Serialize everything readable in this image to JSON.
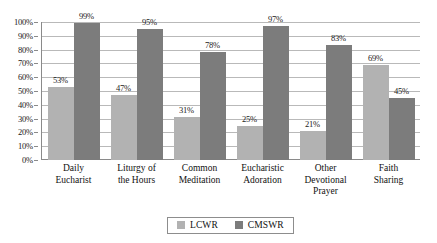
{
  "chart_data": {
    "type": "bar",
    "title": "",
    "xlabel": "",
    "ylabel": "",
    "ylim": [
      0,
      100
    ],
    "grid": true,
    "legend_position": "bottom",
    "categories": [
      "Daily\nEucharist",
      "Liturgy of\nthe Hours",
      "Common\nMeditation",
      "Eucharistic\nAdoration",
      "Other\nDevotional\nPrayer",
      "Faith\nSharing"
    ],
    "ticks": [
      "0%",
      "10%",
      "20%",
      "30%",
      "40%",
      "50%",
      "60%",
      "70%",
      "80%",
      "90%",
      "100%"
    ],
    "series": [
      {
        "name": "LCWR",
        "color": "#b2b2b2",
        "values": [
          53,
          47,
          31,
          25,
          21,
          69
        ],
        "labels": [
          "53%",
          "47%",
          "31%",
          "25%",
          "21%",
          "69%"
        ]
      },
      {
        "name": "CMSWR",
        "color": "#7c7c7c",
        "values": [
          99,
          95,
          78,
          97,
          83,
          45
        ],
        "labels": [
          "99%",
          "95%",
          "78%",
          "97%",
          "83%",
          "45%"
        ]
      }
    ]
  },
  "legend": {
    "items": [
      {
        "label": "LCWR",
        "swatch": "#b2b2b2"
      },
      {
        "label": "CMSWR",
        "swatch": "#7c7c7c"
      }
    ]
  }
}
